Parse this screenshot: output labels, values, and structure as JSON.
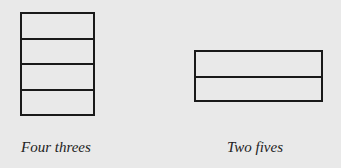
{
  "diagram": {
    "figures": [
      {
        "id": "left",
        "caption": "Four threes",
        "rows": 4,
        "orientation": "vertical stack"
      },
      {
        "id": "right",
        "caption": "Two fives",
        "rows": 2,
        "orientation": "horizontal bars"
      }
    ]
  },
  "colors": {
    "background": "#e9e9e9",
    "stroke": "#1a1a1a",
    "text": "#222222"
  }
}
